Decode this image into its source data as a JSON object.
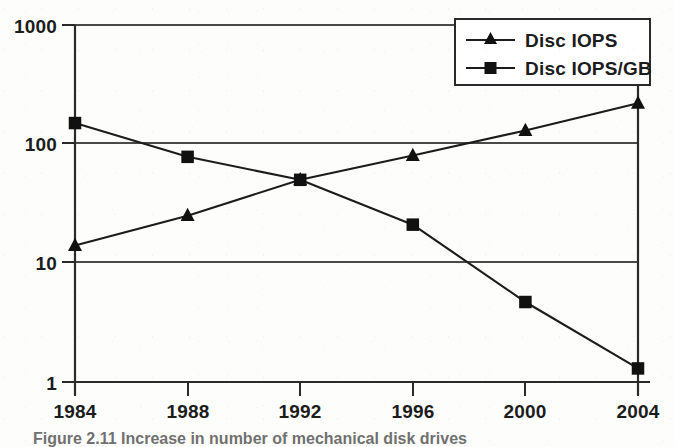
{
  "figure": {
    "caption": "Figure 2.11  Increase in number of mechanical disk drives",
    "background_color": "#fdfdfc",
    "ink_color": "#1c1c1c",
    "gridline_color": "#4a4a4a"
  },
  "legend": {
    "position": "top-right",
    "entries": [
      {
        "label": "Disc IOPS",
        "marker": "triangle-marker",
        "marker_icon": "triangle-up-icon"
      },
      {
        "label": "Disc IOPS/GB",
        "marker": "square-marker",
        "marker_icon": "square-icon"
      }
    ]
  },
  "axes": {
    "y_tick_labels": [
      "1000",
      "100",
      "10",
      "1"
    ],
    "x_tick_labels": [
      "1984",
      "1988",
      "1992",
      "1996",
      "2000",
      "2004"
    ],
    "y_scale": "log",
    "ylabel": "",
    "xlabel": ""
  },
  "chart_data": {
    "type": "line",
    "title": "",
    "subtitle": "",
    "xlabel": "",
    "ylabel": "",
    "x": [
      1984,
      1988,
      1992,
      1996,
      2000,
      2004
    ],
    "categories": [
      "1984",
      "1988",
      "1992",
      "1996",
      "2000",
      "2004"
    ],
    "yscale": "log",
    "ylim": [
      1,
      1000
    ],
    "y_ticks": [
      1,
      10,
      100,
      1000
    ],
    "y_tick_labels": [
      "1",
      "10",
      "100",
      "1000"
    ],
    "grid": true,
    "grid_axis": "y",
    "legend_position": "upper right",
    "series": [
      {
        "name": "Disc IOPS",
        "marker": "triangle",
        "values": [
          14,
          25,
          50,
          80,
          130,
          220
        ]
      },
      {
        "name": "Disc IOPS/GB",
        "marker": "square",
        "values": [
          150,
          78,
          50,
          21,
          4.7,
          1.3
        ]
      }
    ],
    "annotations": []
  }
}
